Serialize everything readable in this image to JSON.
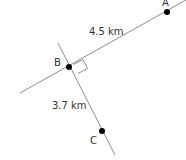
{
  "diagram": {
    "points": [
      {
        "id": "A",
        "label": "A",
        "x": 167,
        "y": 12
      },
      {
        "id": "B",
        "label": "B",
        "x": 69,
        "y": 67
      },
      {
        "id": "C",
        "label": "C",
        "x": 102,
        "y": 131
      }
    ],
    "segments": [
      {
        "from": "A",
        "to": "B",
        "label": "4.5 km"
      },
      {
        "from": "B",
        "to": "C",
        "label": "3.7 km"
      }
    ],
    "right_angle_at": "B",
    "colors": {
      "line": "#808080",
      "point": "#000000",
      "text": "#333333"
    }
  }
}
